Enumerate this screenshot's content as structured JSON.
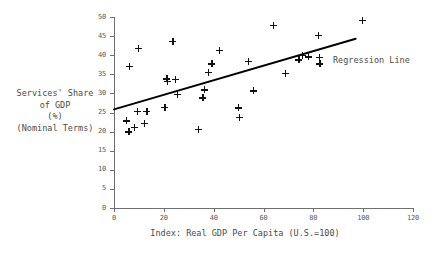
{
  "chart_data": {
    "type": "scatter",
    "title": "",
    "xlabel": "Index: Real GDP Per Capita (U.S.=100)",
    "ylabel": "Services' Share\nof GDP\n(%)\n(Nominal Terms)",
    "xlim": [
      0,
      120
    ],
    "ylim": [
      0,
      50
    ],
    "xticks": [
      0,
      20,
      40,
      60,
      80,
      100,
      120
    ],
    "yticks": [
      0,
      5,
      10,
      15,
      20,
      25,
      30,
      35,
      40,
      45,
      50
    ],
    "grid": false,
    "legend_position": "inside-right",
    "marker_style": "plus",
    "marker_color": "#111111",
    "axis_color": "#6f6f6f",
    "text_color": "#4a4a4a",
    "legend": [
      {
        "label": "Regression Line",
        "type": "line",
        "color": "#000000"
      }
    ],
    "annotations": [
      {
        "text": "Regression Line",
        "x": 100,
        "y": 39.5
      }
    ],
    "series": [
      {
        "name": "Countries",
        "type": "scatter",
        "points": [
          {
            "x": 5.0,
            "y": 22.8
          },
          {
            "x": 6.0,
            "y": 19.9
          },
          {
            "x": 6.2,
            "y": 37.0
          },
          {
            "x": 8.2,
            "y": 21.2
          },
          {
            "x": 9.3,
            "y": 25.3
          },
          {
            "x": 9.8,
            "y": 41.8
          },
          {
            "x": 12.3,
            "y": 22.2
          },
          {
            "x": 13.2,
            "y": 25.3
          },
          {
            "x": 20.4,
            "y": 26.3
          },
          {
            "x": 21.2,
            "y": 33.8
          },
          {
            "x": 21.5,
            "y": 33.2
          },
          {
            "x": 23.6,
            "y": 43.6
          },
          {
            "x": 24.6,
            "y": 33.6
          },
          {
            "x": 25.3,
            "y": 29.7
          },
          {
            "x": 33.8,
            "y": 20.6
          },
          {
            "x": 35.6,
            "y": 28.8
          },
          {
            "x": 36.2,
            "y": 30.9
          },
          {
            "x": 37.8,
            "y": 35.5
          },
          {
            "x": 39.3,
            "y": 37.7
          },
          {
            "x": 42.4,
            "y": 41.3
          },
          {
            "x": 49.8,
            "y": 26.2
          },
          {
            "x": 50.2,
            "y": 23.8
          },
          {
            "x": 53.8,
            "y": 38.4
          },
          {
            "x": 55.9,
            "y": 30.7
          },
          {
            "x": 64.0,
            "y": 47.9
          },
          {
            "x": 68.9,
            "y": 35.3
          },
          {
            "x": 74.2,
            "y": 38.8
          },
          {
            "x": 75.5,
            "y": 40.0
          },
          {
            "x": 78.0,
            "y": 39.6
          },
          {
            "x": 82.1,
            "y": 45.2
          },
          {
            "x": 82.4,
            "y": 39.5
          },
          {
            "x": 82.6,
            "y": 37.7
          },
          {
            "x": 99.8,
            "y": 49.1
          }
        ]
      },
      {
        "name": "Regression Line",
        "type": "line",
        "points": [
          {
            "x": 0.0,
            "y": 25.8
          },
          {
            "x": 97.0,
            "y": 44.3
          }
        ]
      }
    ]
  }
}
